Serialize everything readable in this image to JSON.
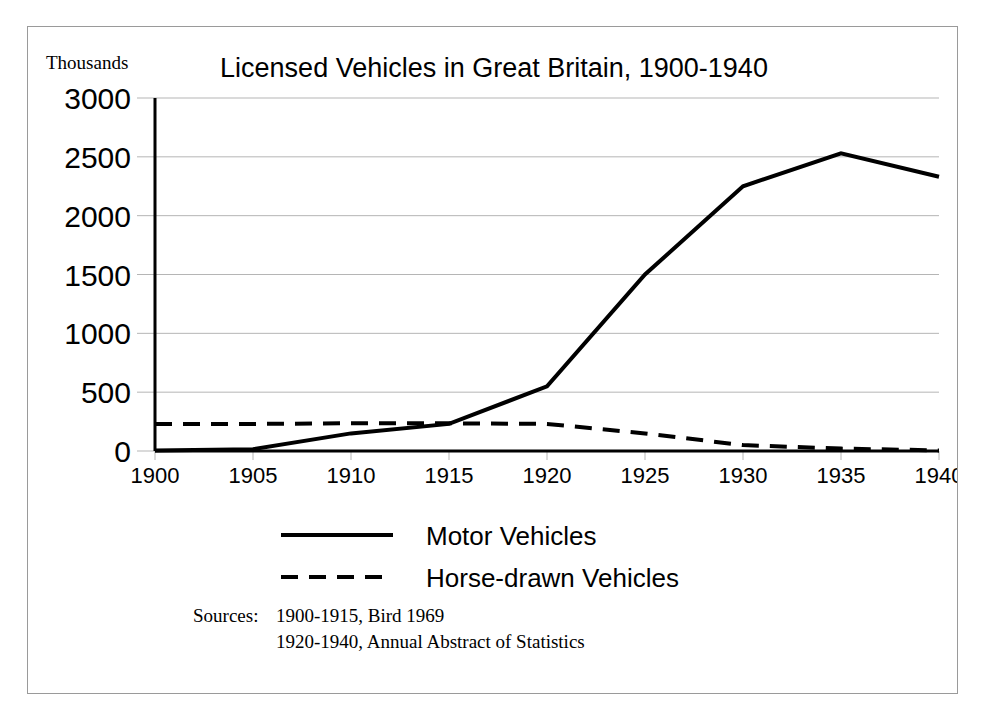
{
  "figure": {
    "axis_unit_label": "Thousands",
    "title": "Licensed Vehicles in Great Britain, 1900-1940",
    "border_color": "#9a9a9a",
    "background_color": "#ffffff",
    "line_color": "#000000",
    "gridline_color": "#b5b5b5"
  },
  "legend": {
    "position": "bottom-center",
    "entries": [
      {
        "label": "Motor Vehicles",
        "style": "solid"
      },
      {
        "label": "Horse-drawn Vehicles",
        "style": "dashed"
      }
    ]
  },
  "sources": {
    "label": "Sources:",
    "lines": [
      "1900-1915, Bird 1969",
      "1920-1940, Annual Abstract of Statistics"
    ]
  },
  "chart_data": {
    "type": "line",
    "title": "Licensed Vehicles in Great Britain, 1900-1940",
    "xlabel": "",
    "ylabel": "Thousands",
    "x": [
      1900,
      1905,
      1910,
      1915,
      1920,
      1925,
      1930,
      1935,
      1940
    ],
    "xticklabels": [
      "1900",
      "1905",
      "1910",
      "1915",
      "1920",
      "1925",
      "1930",
      "1935",
      "1940"
    ],
    "yticks": [
      0,
      500,
      1000,
      1500,
      2000,
      2500,
      3000
    ],
    "yticklabels": [
      "0",
      "500",
      "1000",
      "1500",
      "2000",
      "2500",
      "3000"
    ],
    "xlim": [
      1900,
      1940
    ],
    "ylim": [
      0,
      3000
    ],
    "grid": "horizontal",
    "legend_position": "bottom-center",
    "series": [
      {
        "name": "Motor Vehicles",
        "style": "solid",
        "values": [
          5,
          15,
          150,
          230,
          550,
          1500,
          2250,
          2530,
          2330
        ]
      },
      {
        "name": "Horse-drawn Vehicles",
        "style": "dashed",
        "values": [
          230,
          230,
          235,
          235,
          230,
          150,
          50,
          20,
          5
        ]
      }
    ]
  }
}
